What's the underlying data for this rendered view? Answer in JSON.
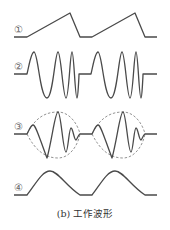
{
  "figure": {
    "caption": "(b) 工作波形",
    "waveforms": [
      {
        "id": "1",
        "label": "①",
        "description": "sawtooth ramp"
      },
      {
        "id": "2",
        "label": "②",
        "description": "chirp sine burst"
      },
      {
        "id": "3",
        "label": "③",
        "description": "amplitude-modulated chirp with dashed envelope"
      },
      {
        "id": "4",
        "label": "④",
        "description": "half-sine pulses"
      }
    ],
    "colors": {
      "stroke": "#4a4a4a",
      "envelope": "#777777",
      "background": "#ffffff"
    }
  }
}
